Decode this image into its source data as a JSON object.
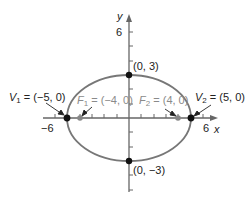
{
  "diagram": {
    "type": "ellipse",
    "colors": {
      "axis": "#666666",
      "ellipse": "#777777",
      "vertex_point": "#111111",
      "focus_point": "#888888",
      "focus_label": "#8a8a8a",
      "text": "#222222"
    },
    "axes": {
      "x_label": "x",
      "y_label": "y",
      "x_tick_labels": {
        "neg": "−6",
        "pos": "6"
      },
      "y_tick_label": "6"
    },
    "points": {
      "top": "(0, 3)",
      "bottom": "(0, −3)",
      "v1_name": "V",
      "v1_sub": "1",
      "v1_value": " = (−5, 0)",
      "v2_name": "V",
      "v2_sub": "2",
      "v2_value": " = (5, 0)",
      "f1_name": "F",
      "f1_sub": "1",
      "f1_value": " = (−4, 0)",
      "f2_name": "F",
      "f2_sub": "2",
      "f2_value": " = (4, 0)"
    }
  }
}
